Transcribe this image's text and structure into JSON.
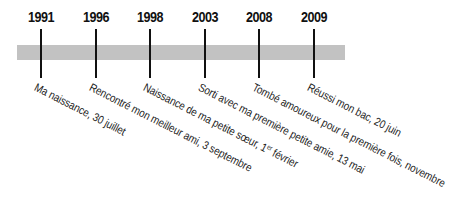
{
  "timeline": {
    "bar_color": "#c2c2c2",
    "tick_color": "#111111",
    "events": [
      {
        "year": "1991",
        "label": "Ma naissance, 30 juillet",
        "x": 41
      },
      {
        "year": "1996",
        "label": "Rencontré mon meilleur ami, 3 septembre",
        "x": 96
      },
      {
        "year": "1998",
        "label_pre": "Naissance de ma petite sœur, 1",
        "label_sup": "er",
        "label_post": " février",
        "x": 150
      },
      {
        "year": "2003",
        "label": "Sorti avec ma première petite amie, 13 mai",
        "x": 205
      },
      {
        "year": "2008",
        "label": "Tombé amoureux pour la première fois, novembre",
        "x": 259
      },
      {
        "year": "2009",
        "label": "Réussi mon bac, 20 juin",
        "x": 314
      }
    ]
  }
}
